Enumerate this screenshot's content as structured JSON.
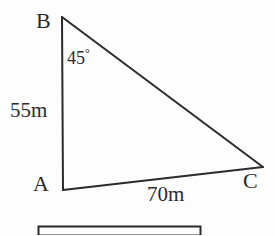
{
  "figure": {
    "type": "geometry-triangle-diagram",
    "background_color": "#fdfdfd",
    "stroke_color": "#2b2b2b",
    "vertices": {
      "B": {
        "label": "B",
        "x": 62,
        "y": 17
      },
      "A": {
        "label": "A",
        "x": 63,
        "y": 190
      },
      "C": {
        "label": "C",
        "x": 263,
        "y": 167
      }
    },
    "sides": [
      {
        "name": "AB",
        "label": "55m",
        "from": "A",
        "to": "B"
      },
      {
        "name": "AC",
        "label": "70m",
        "from": "A",
        "to": "C"
      },
      {
        "name": "BC",
        "label": "",
        "from": "B",
        "to": "C"
      }
    ],
    "angles": [
      {
        "at": "B",
        "value": "45",
        "unit": "°",
        "label": "45°"
      }
    ],
    "bottom_bar": {
      "present": true,
      "cropped": true,
      "x": 38,
      "y": 226,
      "width": 162,
      "height": 9
    }
  },
  "labels": {
    "vertex_b": "B",
    "vertex_a": "A",
    "vertex_c": "C",
    "side_ab": "55m",
    "side_ac": "70m",
    "angle_b_value": "45",
    "angle_b_unit": "°"
  }
}
